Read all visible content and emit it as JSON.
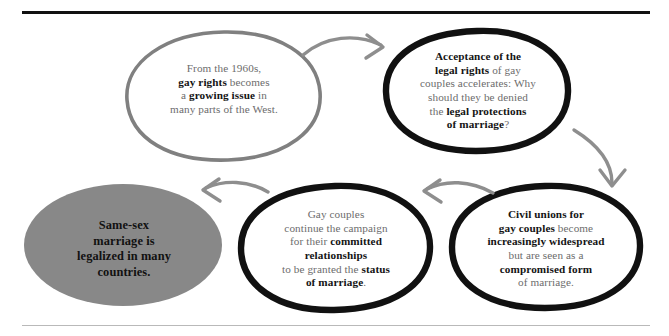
{
  "diagram": {
    "type": "flow-diagram",
    "colors": {
      "background": "#ffffff",
      "body_text": "#6c6c6c",
      "emphasis_text": "#141414",
      "gray_stroke": "#808080",
      "black_stroke": "#111111",
      "gray_fill": "#888888",
      "rule_top": "#111111",
      "rule_bottom": "#b9b9b9"
    },
    "nodes": [
      {
        "id": "node-1",
        "name": "gay-rights-growing-issue",
        "shape": "ellipse",
        "style": "gray-outline",
        "fill": "none",
        "stroke": "#808080",
        "text_plain": "From the 1960s, gay rights becomes a growing issue in many parts of the West.",
        "text_html": "From the 1960s,<br><b>gay rights</b> becomes<br>a <b>growing issue</b> in<br>many parts of the West."
      },
      {
        "id": "node-2",
        "name": "acceptance-legal-rights",
        "shape": "ellipse",
        "style": "black-outline",
        "fill": "none",
        "stroke": "#111111",
        "text_plain": "Acceptance of the legal rights of gay couples accelerates: Why should they be denied the legal protections of marriage?",
        "text_html": "<b>Acceptance of the</b><br><b>legal rights</b> of gay<br>couples accelerates: Why<br>should they be denied<br>the <b>legal protections</b><br><b>of marriage</b>?"
      },
      {
        "id": "node-3",
        "name": "civil-unions-widespread",
        "shape": "ellipse",
        "style": "black-outline",
        "fill": "none",
        "stroke": "#111111",
        "text_plain": "Civil unions for gay couples become increasingly widespread but are seen as a compromised form of marriage.",
        "text_html": "<b>Civil unions for</b><br><b>gay couples</b> become<br><b>increasingly widespread</b><br>but are seen as a<br><b>compromised form</b><br>of marriage."
      },
      {
        "id": "node-4",
        "name": "campaign-status-of-marriage",
        "shape": "ellipse",
        "style": "black-outline",
        "fill": "none",
        "stroke": "#111111",
        "text_plain": "Gay couples continue the campaign for their committed relationships to be granted the status of marriage.",
        "text_html": "Gay couples<br>continue the campaign<br>for their <b>committed</b><br><b>relationships</b><br>to be granted the <b>status</b><br><b>of marriage</b>."
      },
      {
        "id": "node-5",
        "name": "same-sex-marriage-legalized",
        "shape": "ellipse",
        "style": "gray-filled",
        "fill": "#888888",
        "stroke": "none",
        "text_plain": "Same-sex marriage is legalized in many countries.",
        "text_html": "Same-sex<br>marriage is<br>legalized in many<br>countries."
      }
    ],
    "arrows": [
      {
        "id": "arrow-1",
        "name": "arrow-node1-to-node2",
        "from": "node-1",
        "to": "node-2",
        "direction": "right"
      },
      {
        "id": "arrow-2",
        "name": "arrow-node2-to-node3",
        "from": "node-2",
        "to": "node-3",
        "direction": "down"
      },
      {
        "id": "arrow-3",
        "name": "arrow-node3-to-node4",
        "from": "node-3",
        "to": "node-4",
        "direction": "left"
      },
      {
        "id": "arrow-4",
        "name": "arrow-node4-to-node5",
        "from": "node-4",
        "to": "node-5",
        "direction": "left"
      }
    ]
  }
}
